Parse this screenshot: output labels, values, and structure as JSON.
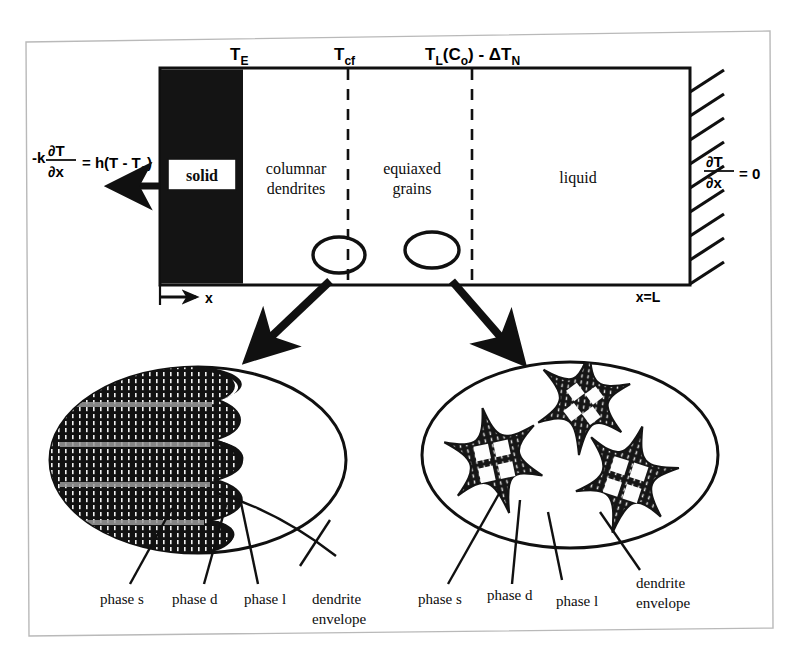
{
  "figure": {
    "background": "#ffffff",
    "ink": "#0d0d0d"
  },
  "domain_bar": {
    "solid_label": "solid",
    "zones": [
      {
        "name": "columnar",
        "line1": "columnar",
        "line2": "dendrites"
      },
      {
        "name": "equiaxed",
        "line1": "equiaxed",
        "line2": "grains"
      },
      {
        "name": "liquid",
        "line1": "liquid",
        "line2": ""
      }
    ]
  },
  "temperature_markers": [
    {
      "name": "eutectic",
      "base": "T",
      "sub": "E",
      "tail": ""
    },
    {
      "name": "columnar-front",
      "base": "T",
      "sub": "cf",
      "tail": ""
    },
    {
      "name": "nucleation-undercool",
      "base": "T",
      "sub": "L",
      "tail": "(C",
      "tail_sub": "o",
      "tail_end": ") - ΔT",
      "tail_end_sub": "N"
    }
  ],
  "boundary_conditions": {
    "left": {
      "name": "convective-bc",
      "lead": "-k",
      "num": "∂T",
      "den": "∂x",
      "rhs": "= h(T - T",
      "rhs_sub": "a",
      "rhs_end": ")"
    },
    "right": {
      "name": "adiabatic-bc",
      "num": "∂T",
      "den": "∂x",
      "rhs": "= 0"
    }
  },
  "axis": {
    "origin_label": "x",
    "end_label": "x=L"
  },
  "insets": {
    "left": {
      "name": "columnar-inset",
      "legend": [
        {
          "label": "phase s"
        },
        {
          "label": "phase d"
        },
        {
          "label": "phase l"
        },
        {
          "label": "dendrite",
          "label2": "envelope"
        }
      ]
    },
    "right": {
      "name": "equiaxed-inset",
      "legend": [
        {
          "label": "phase s"
        },
        {
          "label": "phase d"
        },
        {
          "label": "phase l"
        },
        {
          "label": "dendrite",
          "label2": "envelope"
        }
      ]
    }
  }
}
